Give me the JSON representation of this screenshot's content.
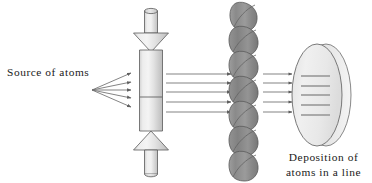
{
  "figure": {
    "width": 372,
    "height": 183,
    "background_color": "#ffffff"
  },
  "labels": {
    "source": "Source of atoms",
    "deposition_line1": "Deposition of",
    "deposition_line2": "atoms in a line"
  },
  "colors": {
    "outline": "#4a4a4a",
    "tube_fill_light": "#f0f0f0",
    "tube_fill_mid": "#dcdcdc",
    "tube_fill_dark": "#c8c8c8",
    "mask_fill": "#8c8c8c",
    "mask_fill_dark": "#757575",
    "mask_outline": "#5a5a5a",
    "disk_fill": "#ececec",
    "disk_outline": "#6b6b6b",
    "deposit_line": "#9a9a9a",
    "arrow": "#6e6e6e",
    "text": "#1a1a1a"
  },
  "components": {
    "source_arrows": {
      "name": "fanning atom beam arrows",
      "count": 5,
      "origin_x": 92,
      "origin_y": 90,
      "tip_x": 134,
      "tip_y_values": [
        73,
        82,
        90,
        98,
        107
      ]
    },
    "collimator_tube": {
      "name": "vertical collimating tube",
      "center_x": 151,
      "top_y": 6,
      "bottom_y": 177,
      "neck_width": 13,
      "body_width": 23,
      "flare_width": 35,
      "septum_y": 97
    },
    "beam_arrows_mid": {
      "name": "collimated beam arrows to mask",
      "count": 5,
      "start_x": 165,
      "end_x": 232,
      "y_values": [
        74,
        83,
        92,
        102,
        112
      ]
    },
    "mask": {
      "name": "stacked cylinder mask grating",
      "count": 7,
      "left_x": 228,
      "right_x": 259,
      "top_y": 4,
      "bottom_y": 180,
      "element_height": 28
    },
    "beam_arrows_right": {
      "name": "masked beam arrows to substrate",
      "count": 5,
      "start_x": 263,
      "end_x": 294,
      "y_values": [
        74,
        83,
        92,
        102,
        112
      ]
    },
    "substrate_disk": {
      "name": "elliptical substrate disk",
      "center_x": 317,
      "center_y": 95,
      "radius_x": 25,
      "radius_y": 51,
      "edge_offset_x": 9
    },
    "deposited_lines": {
      "name": "deposited atom lines on substrate",
      "count": 5,
      "x_start": 300,
      "x_end": 330,
      "y_values": [
        76,
        86,
        95,
        105,
        115
      ]
    }
  }
}
